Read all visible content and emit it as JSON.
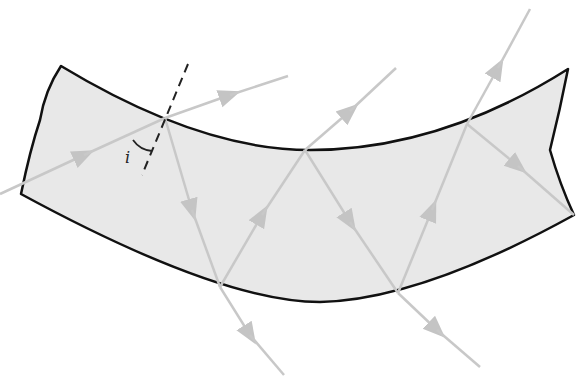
{
  "figure": {
    "angle_label": "i",
    "colors": {
      "fiber_fill": "#e8e8e8",
      "fiber_outline": "#111111",
      "ray": "#c8c8c8",
      "normal": "#222222",
      "background": "#ffffff"
    }
  }
}
